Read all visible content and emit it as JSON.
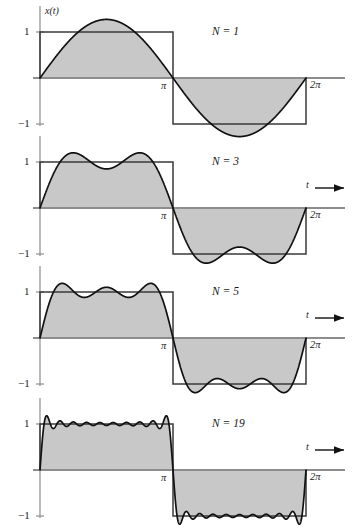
{
  "figure": {
    "caption_axis_label": "x(t)",
    "time_axis_label": "t",
    "background_color": "#ffffff",
    "fill_color": "#c8c8c8",
    "curve_color": "#111111",
    "square_color": "#3a3a3a",
    "axis_color": "#8d8d8d"
  },
  "ticks": {
    "y_pos": "1",
    "y_neg": "−1",
    "x_pi": "π",
    "x_2pi": "2π"
  },
  "panels": [
    {
      "label": "N = 1",
      "harmonics": 1,
      "show_t_axis": false
    },
    {
      "label": "N = 3",
      "harmonics": 3,
      "show_t_axis": true
    },
    {
      "label": "N = 5",
      "harmonics": 5,
      "show_t_axis": true
    },
    {
      "label": "N = 19",
      "harmonics": 19,
      "show_t_axis": true
    }
  ],
  "chart_data": {
    "type": "line",
    "xlabel": "t",
    "ylabel": "x(t)",
    "xlim": [
      0,
      6.283185307179586
    ],
    "ylim": [
      -1.35,
      1.35
    ],
    "xticks": [
      3.141592653589793,
      6.283185307179586
    ],
    "xticklabels": [
      "π",
      "2π"
    ],
    "yticks": [
      1,
      -1
    ],
    "yticklabels": [
      "1",
      "−1"
    ],
    "grid": false,
    "legend": null,
    "reference_series": {
      "name": "square wave",
      "description": "x(t) = +1 for 0 < t < π, −1 for π < t < 2π",
      "values_by_interval": [
        {
          "from": 0,
          "to": 3.141592653589793,
          "value": 1
        },
        {
          "from": 3.141592653589793,
          "to": 6.283185307179586,
          "value": -1
        }
      ]
    },
    "series": [
      {
        "name": "N = 1",
        "harmonics": 1,
        "formula": "x(t) = (4/π) Σ_{k odd, k≤1} sin(kt)/k",
        "peak_overshoot": 1.273,
        "annotation": "N = 1"
      },
      {
        "name": "N = 3",
        "harmonics": 3,
        "formula": "x(t) = (4/π) Σ_{k odd, k≤3} sin(kt)/k",
        "peak_overshoot": 1.2,
        "annotation": "N = 3"
      },
      {
        "name": "N = 5",
        "harmonics": 5,
        "formula": "x(t) = (4/π) Σ_{k odd, k≤5} sin(kt)/k",
        "peak_overshoot": 1.19,
        "annotation": "N = 5"
      },
      {
        "name": "N = 19",
        "harmonics": 19,
        "formula": "x(t) = (4/π) Σ_{k odd, k≤19} sin(kt)/k",
        "peak_overshoot": 1.18,
        "annotation": "N = 19"
      }
    ]
  }
}
